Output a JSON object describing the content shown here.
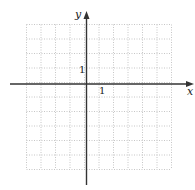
{
  "diagram": {
    "type": "coordinate-grid",
    "x_axis_label": "x",
    "y_axis_label": "y",
    "x_tick_label": "1",
    "y_tick_label": "1",
    "x_range": [
      -4,
      6
    ],
    "y_range": [
      -6,
      4
    ],
    "grid_cells_x": 10,
    "grid_cells_y": 10,
    "grid_style": "dotted",
    "colors": {
      "axis": "#333333",
      "grid": "#b8b8b8",
      "background": "#ffffff"
    }
  }
}
